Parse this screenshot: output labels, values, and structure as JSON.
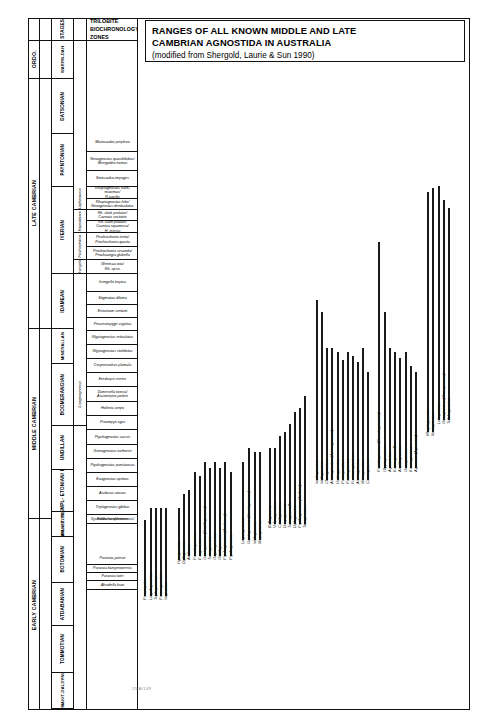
{
  "title": {
    "line1": "RANGES OF ALL KNOWN MIDDLE AND LATE",
    "line2": "CAMBRIAN AGNOSTIDA IN AUSTRALIA",
    "line3": "(modified from Shergold, Laurie & Sun 1990)"
  },
  "figure_number": "25/A/149",
  "table": {
    "header": {
      "stages": "STAGES",
      "zones": "TRILOBITE\nBIOCHRONOLOGY:\nZONES"
    },
    "systems": [
      {
        "label": "ORDO.",
        "top": 41,
        "height": 38
      },
      {
        "label": "LATE  CAMBRIAN",
        "top": 79,
        "height": 250
      },
      {
        "label": "MIDDLE  CAMBRIAN",
        "top": 329,
        "height": 190
      },
      {
        "label": "EARLY  CAMBRIAN",
        "top": 519,
        "height": 172
      }
    ],
    "stages": [
      {
        "label": "WARRN-DAH",
        "top": 41,
        "height": 38
      },
      {
        "label": "DATSONIAN",
        "top": 79,
        "height": 55
      },
      {
        "label": "PAYNTONIAN",
        "top": 134,
        "height": 53
      },
      {
        "label": "IVERIAN",
        "top": 187,
        "height": 87
      },
      {
        "label": "IDAMEAN",
        "top": 274,
        "height": 55
      },
      {
        "label": "MINDYALLAN",
        "top": 329,
        "height": 35
      },
      {
        "label": "BOOMERANGIAN",
        "top": 364,
        "height": 62
      },
      {
        "label": "UNDILLAN",
        "top": 426,
        "height": 44
      },
      {
        "label": "LATE TEMPL- ETONIAN/ FLORAN",
        "top": 470,
        "height": 42
      },
      {
        "label": "TEMPL- ETONIAN",
        "top": 512,
        "height": 25
      },
      {
        "label": "ORDIAN/ E. TEMP.",
        "top": 512,
        "height": 25
      },
      {
        "label": "BOTOMIAN",
        "top": 537,
        "height": 46
      },
      {
        "label": "ATDABANIAN",
        "top": 583,
        "height": 43
      },
      {
        "label": "TOMMOTIAN",
        "top": 626,
        "height": 47
      },
      {
        "label": "NEMAKIT-DALDYNIAN",
        "top": 673,
        "height": 36
      }
    ],
    "subzones": [
      {
        "label": "Lophosaurus",
        "top": 187,
        "height": 23
      },
      {
        "label": "Hapsidocare",
        "top": 210,
        "height": 23
      },
      {
        "label": "Peichiashania",
        "top": 233,
        "height": 27
      },
      {
        "label": "Irvingella",
        "top": 260,
        "height": 14
      },
      {
        "label": "Lisogoragnostus",
        "top": 364,
        "height": 62
      }
    ],
    "zones": [
      {
        "text": "Mictosaukia perplexa",
        "top": 134,
        "height": 18
      },
      {
        "text": "Neoagnostus quasibilobus/ Shergoldia nomas",
        "top": 152,
        "height": 19
      },
      {
        "text": "Sinosaukia impages",
        "top": 171,
        "height": 16
      },
      {
        "text": "Rhaptagnostus clark-maximus/R.papilio",
        "top": 187,
        "height": 12
      },
      {
        "text": "Rhaptagnostus felix/ Neoagnostus denticulatus",
        "top": 199,
        "height": 11
      },
      {
        "text": "Rh. clark prolatus/ Caznaia sectatrix",
        "top": 210,
        "height": 11
      },
      {
        "text": "Rh. clark patulus/ Caznaia squamosa/ H. injesta",
        "top": 221,
        "height": 12
      },
      {
        "text": "Peichiashania tertia/ Peichiashania quarta",
        "top": 233,
        "height": 14
      },
      {
        "text": "Peichiashania secunda/ Prochuangia glabella",
        "top": 247,
        "height": 13
      },
      {
        "text": "Wentsua iota/ Rh. apsis",
        "top": 260,
        "height": 14
      },
      {
        "text": "Irvingella tropica",
        "top": 274,
        "height": 18
      },
      {
        "text": "Stigmatoa diloma",
        "top": 292,
        "height": 13
      },
      {
        "text": "Erixanium sentum",
        "top": 305,
        "height": 13
      },
      {
        "text": "Proceratopyge cryptica",
        "top": 318,
        "height": 13
      },
      {
        "text": "Glyptagnostus reticulatus",
        "top": 331,
        "height": 14
      },
      {
        "text": "Glyptagnostus stolidotus",
        "top": 345,
        "height": 14
      },
      {
        "text": "Corynexochus plumula",
        "top": 359,
        "height": 14
      },
      {
        "text": "Eredaspis eretes",
        "top": 373,
        "height": 14
      },
      {
        "text": "Damesella torosa/ Ascionepea janitrix",
        "top": 387,
        "height": 15
      },
      {
        "text": "Holteria arepo",
        "top": 402,
        "height": 14
      },
      {
        "text": "Proampyx agra",
        "top": 416,
        "height": 14
      },
      {
        "text": "Ptychagnostus cassis",
        "top": 430,
        "height": 15
      },
      {
        "text": "Goniagnostus nathorsti",
        "top": 445,
        "height": 14
      },
      {
        "text": "Ptychagnostus punctuosus",
        "top": 459,
        "height": 14
      },
      {
        "text": "Euagnostus opimus",
        "top": 473,
        "height": 14
      },
      {
        "text": "Acidusus atavus",
        "top": 487,
        "height": 14
      },
      {
        "text": "Triplagnostus gibbus",
        "top": 501,
        "height": 14
      },
      {
        "text": "Redlichia chinensis",
        "top": 515,
        "height": 9
      },
      {
        "text": "Xystridura templetonensis/",
        "top": 515,
        "height": 9
      },
      {
        "text": "Pararaia janeae",
        "top": 552,
        "height": 13
      },
      {
        "text": "Pararaia bunyerooensis",
        "top": 565,
        "height": 8
      },
      {
        "text": "Pararaia tatei",
        "top": 573,
        "height": 8
      },
      {
        "text": "Abadiella huoi",
        "top": 581,
        "height": 9
      }
    ]
  },
  "chart_data": {
    "type": "range-chart",
    "title": "Ranges of all known Middle and Late Cambrian Agnostida in Australia",
    "ylabel": "Stratigraphic position (trilobite zones)",
    "xlabel": "Taxa",
    "note": "Each vertical bar is the stratigraphic range of one agnostoid taxon; taxon name written vertically beneath its bar.",
    "taxa": [
      {
        "name": "Peronopsis",
        "x": 6,
        "top": 520,
        "bottom": 596,
        "label_top": 600
      },
      {
        "name": "Lingulagnostus",
        "x": 12,
        "top": 508,
        "bottom": 596,
        "label_top": 600
      },
      {
        "name": "Triplagnostus",
        "x": 17,
        "top": 508,
        "bottom": 596,
        "label_top": 600
      },
      {
        "name": "Peronagnostus",
        "x": 22,
        "top": 508,
        "bottom": 596,
        "label_top": 600
      },
      {
        "name": "Itagnostus",
        "x": 27,
        "top": 508,
        "bottom": 596,
        "label_top": 600
      },
      {
        "name": "Hypagnostus",
        "x": 40,
        "top": 508,
        "bottom": 560,
        "label_top": 564
      },
      {
        "name": "Diplagnostus",
        "x": 45,
        "top": 494,
        "bottom": 560,
        "label_top": 564
      },
      {
        "name": "Acidusus",
        "x": 50,
        "top": 490,
        "bottom": 556,
        "label_top": 560
      },
      {
        "name": "Pseudagnostus",
        "x": 56,
        "top": 472,
        "bottom": 556,
        "label_top": 560
      },
      {
        "name": "Euagnostus",
        "x": 61,
        "top": 476,
        "bottom": 556,
        "label_top": 560
      },
      {
        "name": "Goniagnostus (Cotalagnostus)",
        "x": 66,
        "top": 462,
        "bottom": 556,
        "label_top": 560
      },
      {
        "name": "Tomagnostus",
        "x": 71,
        "top": 468,
        "bottom": 556,
        "label_top": 560
      },
      {
        "name": "Onymagnostus",
        "x": 76,
        "top": 462,
        "bottom": 556,
        "label_top": 560
      },
      {
        "name": "Oidalagnostus",
        "x": 81,
        "top": 468,
        "bottom": 556,
        "label_top": 560
      },
      {
        "name": "Ptychagnostus (Acidusus)",
        "x": 86,
        "top": 462,
        "bottom": 556,
        "label_top": 560
      },
      {
        "name": "Ptychagnostus",
        "x": 92,
        "top": 472,
        "bottom": 556,
        "label_top": 560
      },
      {
        "name": "Linguagnostus",
        "x": 104,
        "top": 462,
        "bottom": 540,
        "label_top": 544
      },
      {
        "name": "Goniagnostus (Goniagnostus)",
        "x": 110,
        "top": 448,
        "bottom": 540,
        "label_top": 544
      },
      {
        "name": "Idolagnostus",
        "x": 116,
        "top": 452,
        "bottom": 540,
        "label_top": 544
      },
      {
        "name": "Megagnostus",
        "x": 121,
        "top": 452,
        "bottom": 540,
        "label_top": 544
      },
      {
        "name": "Ballagnostus",
        "x": 131,
        "top": 448,
        "bottom": 524,
        "label_top": 528
      },
      {
        "name": "Valenagnostus",
        "x": 136,
        "top": 448,
        "bottom": 524,
        "label_top": 528
      },
      {
        "name": "Cotalagnostus",
        "x": 141,
        "top": 436,
        "bottom": 524,
        "label_top": 528
      },
      {
        "name": "Doryagnostus",
        "x": 146,
        "top": 432,
        "bottom": 524,
        "label_top": 528
      },
      {
        "name": "Tomagnostella",
        "x": 151,
        "top": 424,
        "bottom": 524,
        "label_top": 528
      },
      {
        "name": "Diplagnostus",
        "x": 156,
        "top": 412,
        "bottom": 524,
        "label_top": 528
      },
      {
        "name": "Ptychagnostus (Aetheia)",
        "x": 161,
        "top": 408,
        "bottom": 524,
        "label_top": 528
      },
      {
        "name": "Taxagnostus",
        "x": 166,
        "top": 396,
        "bottom": 524,
        "label_top": 528
      },
      {
        "name": "Innitagnostus",
        "x": 178,
        "top": 300,
        "bottom": 480,
        "label_top": 484
      },
      {
        "name": "Idolagnostus",
        "x": 183,
        "top": 312,
        "bottom": 480,
        "label_top": 484
      },
      {
        "name": "Clavagnostus",
        "x": 188,
        "top": 348,
        "bottom": 480,
        "label_top": 484
      },
      {
        "name": "Ammagnostus (Ammagnostus)",
        "x": 193,
        "top": 348,
        "bottom": 480,
        "label_top": 484
      },
      {
        "name": "Hadragnostus",
        "x": 199,
        "top": 352,
        "bottom": 480,
        "label_top": 484
      },
      {
        "name": "Pentagnostus",
        "x": 204,
        "top": 360,
        "bottom": 480,
        "label_top": 484
      },
      {
        "name": "Peratagnostus",
        "x": 209,
        "top": 352,
        "bottom": 480,
        "label_top": 484
      },
      {
        "name": "Formosagnostus",
        "x": 214,
        "top": 356,
        "bottom": 480,
        "label_top": 484
      },
      {
        "name": "Ammagnostus",
        "x": 219,
        "top": 362,
        "bottom": 480,
        "label_top": 484
      },
      {
        "name": "Micragnostus",
        "x": 224,
        "top": 348,
        "bottom": 480,
        "label_top": 484
      },
      {
        "name": "Connagnostus",
        "x": 229,
        "top": 372,
        "bottom": 480,
        "label_top": 484
      },
      {
        "name": "Pseudagnostus (Pseudagnostina)",
        "x": 240,
        "top": 242,
        "bottom": 468,
        "label_top": 472
      },
      {
        "name": "Glyptagnostus",
        "x": 246,
        "top": 312,
        "bottom": 468,
        "label_top": 472
      },
      {
        "name": "Agnostotes",
        "x": 251,
        "top": 348,
        "bottom": 468,
        "label_top": 472
      },
      {
        "name": "Kormagnostella",
        "x": 256,
        "top": 352,
        "bottom": 468,
        "label_top": 472
      },
      {
        "name": "Aspidagnostus",
        "x": 261,
        "top": 358,
        "bottom": 468,
        "label_top": 472
      },
      {
        "name": "Oncagnostus",
        "x": 267,
        "top": 352,
        "bottom": 468,
        "label_top": 472
      },
      {
        "name": "Kormagnostus",
        "x": 272,
        "top": 366,
        "bottom": 468,
        "label_top": 472
      },
      {
        "name": "Agnostus (Agnostus)",
        "x": 277,
        "top": 372,
        "bottom": 468,
        "label_top": 472
      },
      {
        "name": "Rhaptagnostus",
        "x": 289,
        "top": 192,
        "bottom": 432,
        "label_top": 436
      },
      {
        "name": "Neoagnostus",
        "x": 294,
        "top": 188,
        "bottom": 432,
        "label_top": 436
      },
      {
        "name": "Lotagnostus",
        "x": 300,
        "top": 186,
        "bottom": 420,
        "label_top": 424
      },
      {
        "name": "Oncagnostus (Oncagnostus)",
        "x": 305,
        "top": 200,
        "bottom": 420,
        "label_top": 424
      },
      {
        "name": "Trilobagnostus",
        "x": 310,
        "top": 208,
        "bottom": 420,
        "label_top": 424
      }
    ]
  }
}
